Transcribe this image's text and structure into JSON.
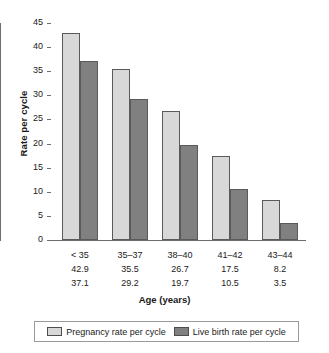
{
  "chart_data": {
    "type": "bar",
    "title": "",
    "xlabel": "Age (years)",
    "ylabel": "Rate per cycle",
    "ylim": [
      0,
      45
    ],
    "ytick_step": 5,
    "yticks": [
      0,
      5,
      10,
      15,
      20,
      25,
      30,
      35,
      40,
      45
    ],
    "ytick_labels": [
      "0",
      "5",
      "10",
      "15",
      "20",
      "25",
      "30",
      "35",
      "40",
      "45"
    ],
    "grid": false,
    "legend_position": "bottom",
    "categories": [
      "< 35",
      "35–37",
      "38–40",
      "41–42",
      "43–44"
    ],
    "series": [
      {
        "name": "Pregnancy rate per cycle",
        "color": "#d8d8d8",
        "values": [
          42.9,
          35.5,
          26.7,
          17.5,
          8.2
        ],
        "value_labels": [
          "42.9",
          "35.5",
          "26.7",
          "17.5",
          "8.2"
        ]
      },
      {
        "name": "Live birth rate per cycle",
        "color": "#808080",
        "values": [
          37.1,
          29.2,
          19.7,
          10.5,
          3.5
        ],
        "value_labels": [
          "37.1",
          "29.2",
          "19.7",
          "10.5",
          "3.5"
        ]
      }
    ]
  },
  "axes": {
    "y_title": "Rate per cycle",
    "x_title": "Age (years)"
  },
  "legend": {
    "items": [
      {
        "label": "Pregnancy rate per cycle",
        "swatch": "light"
      },
      {
        "label": "Live birth rate per cycle",
        "swatch": "dark"
      }
    ]
  }
}
